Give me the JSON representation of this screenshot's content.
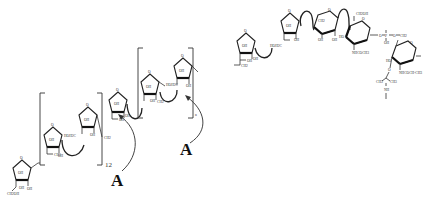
{
  "diagram": {
    "type": "chemical-structure",
    "units": [
      {
        "id": "f1",
        "ring": "furanose",
        "x": 22,
        "y": 168,
        "labels": {
          "ring_o": "O",
          "c": "OH",
          "sub": "CH2OH",
          "sub2": "OH"
        }
      },
      {
        "id": "f2",
        "ring": "furanose",
        "x": 53,
        "y": 125,
        "labels": {
          "ring_o": "O",
          "c": "OH",
          "sub": "OH",
          "sub2": "OH"
        }
      },
      {
        "id": "f3",
        "ring": "furanose",
        "x": 88,
        "y": 105,
        "labels": {
          "ring_o": "O",
          "c": "OH",
          "sub": "OH",
          "sub2": "OH"
        }
      },
      {
        "id": "f4",
        "ring": "furanose",
        "x": 118,
        "y": 97,
        "labels": {
          "ring_o": "O",
          "c": "OH",
          "sub": "OH",
          "sub2": "OH"
        }
      },
      {
        "id": "f5",
        "ring": "furanose",
        "x": 150,
        "y": 77,
        "labels": {
          "ring_o": "O",
          "c": "OH",
          "sub": "OH",
          "sub2": "OH"
        }
      },
      {
        "id": "f6",
        "ring": "furanose",
        "x": 183,
        "y": 68,
        "labels": {
          "ring_o": "O",
          "c": "OH",
          "sub": "OH",
          "sub2": "OH"
        }
      },
      {
        "id": "f7",
        "ring": "furanose",
        "x": 246,
        "y": 42,
        "labels": {
          "ring_o": "O",
          "c": "OH",
          "sub": "OH",
          "sub2": "OH"
        }
      },
      {
        "id": "f8",
        "ring": "furanose",
        "x": 290,
        "y": 22,
        "labels": {
          "ring_o": "O",
          "c": "OH",
          "sub": "OH",
          "sub2": "OH"
        }
      }
    ],
    "pyranoses": [
      {
        "id": "p1",
        "x": 325,
        "y": 14,
        "labels": {
          "ring_o": "O",
          "top": "CH2",
          "b1": "OH",
          "b2": "OH"
        }
      },
      {
        "id": "p2",
        "x": 357,
        "y": 26,
        "labels": {
          "ring_o": "O",
          "top": "CH2OH",
          "left": "HO",
          "sub": "NHCOCH3"
        }
      },
      {
        "id": "p3",
        "x": 403,
        "y": 50,
        "labels": {
          "ring_o": "O",
          "left": "HO",
          "sub": "NHCOCH-CH3"
        }
      }
    ],
    "brackets": [
      {
        "id": "b1",
        "repeat": "12"
      },
      {
        "id": "b2",
        "repeat": "n"
      }
    ],
    "annotations": [
      {
        "id": "a1",
        "text": "A"
      },
      {
        "id": "a2",
        "text": "A"
      }
    ],
    "small_labels": {
      "o": "O",
      "oh": "OH",
      "ho": "HO",
      "ch2": "CH2",
      "ch2oh": "CH2OH",
      "hoh2c": "HOH2C",
      "nhac": "NHCOCH3",
      "nhac2": "NHCOCH-CH3",
      "p": "P",
      "ch3": "CH3",
      "nh": "NH"
    }
  }
}
